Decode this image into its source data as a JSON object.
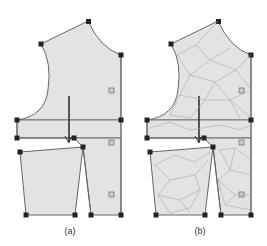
{
  "panels": [
    {
      "id": "a",
      "caption": "(a)",
      "meshed": false
    },
    {
      "id": "b",
      "caption": "(b)",
      "meshed": true
    }
  ],
  "colors": {
    "fill": "#e3e3e3",
    "outline": "#555555",
    "node": "#222222",
    "mesh": "#b0b0b0",
    "arrow": "#333333"
  }
}
